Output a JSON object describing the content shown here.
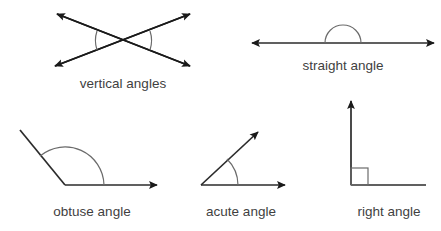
{
  "figure": {
    "background_color": "#ffffff",
    "stroke_color": "#1a1a1a",
    "arc_color": "#6b6b6b",
    "label_color": "#3f3f3f",
    "width": 441,
    "height": 231
  },
  "diagrams": [
    {
      "id": "vertical-angles",
      "label": "vertical angles",
      "angle_type": "vertical",
      "description": "two straight lines crossing with double arrowheads forming opposite vertical angle pairs",
      "arrowheads": 4,
      "arc_count": 2,
      "label_x": 123,
      "label_y": 88
    },
    {
      "id": "straight-angle",
      "label": "straight angle",
      "angle_type": "straight",
      "measure": "180",
      "description": "a horizontal line with arrowheads at both ends and a semicircular arc above the midpoint",
      "arrowheads": 2,
      "arc_count": 1,
      "label_x": 343,
      "label_y": 70
    },
    {
      "id": "obtuse-angle",
      "label": "obtuse angle",
      "angle_type": "obtuse",
      "description": "a ray sloping up to the left and a ray pointing right with a wide arc between them",
      "arrowheads": 1,
      "arc_count": 1,
      "label_x": 92,
      "label_y": 216
    },
    {
      "id": "acute-angle",
      "label": "acute angle",
      "angle_type": "acute",
      "description": "a ray sloping up to the right and a horizontal ray with a narrow arc between them",
      "arrowheads": 2,
      "arc_count": 1,
      "label_x": 241,
      "label_y": 216
    },
    {
      "id": "right-angle",
      "label": "right angle",
      "angle_type": "right",
      "measure": "90",
      "description": "a vertical ray with arrowhead and a horizontal ray meeting at a square right-angle marker",
      "arrowheads": 1,
      "arc_count": 0,
      "marker": "square",
      "label_x": 389,
      "label_y": 216
    }
  ]
}
